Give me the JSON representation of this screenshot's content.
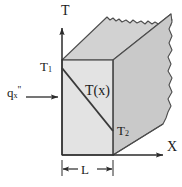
{
  "figure": {
    "kind": "engineering-diagram",
    "background_color": "#ffffff",
    "stroke_color": "#4d4d4d",
    "text_color": "#1a1a1a",
    "faces": {
      "front_fill": "#e3e3e3",
      "top_fill": "#d2d2d2",
      "side_fill": "#c9c9c9"
    },
    "axes": {
      "vertical_label": "T",
      "horizontal_label": "X",
      "origin_x": 62,
      "origin_y": 155
    },
    "labels": {
      "t1": "T",
      "t1_sub": "1",
      "t2": "T",
      "t2_sub": "2",
      "profile": "T(x)",
      "flux": "q",
      "flux_sub": "x",
      "flux_sup": "\"",
      "thickness": "L"
    },
    "geometry": {
      "wall_thickness_label": "L",
      "front_face": {
        "left": 62,
        "right": 113,
        "top": 60,
        "bottom": 155
      },
      "temperature_profile": {
        "description": "linear decrease from T1 at x=0 to T2 at x=L",
        "start": {
          "x": 62,
          "y": 68
        },
        "end": {
          "x": 113,
          "y": 131
        }
      },
      "heat_flux_arrow": {
        "from_x": 26,
        "to_x": 58,
        "y": 97,
        "direction": "positive-x"
      },
      "broken_edge": "torn right-hand boundary indicating the solid extends further"
    }
  }
}
